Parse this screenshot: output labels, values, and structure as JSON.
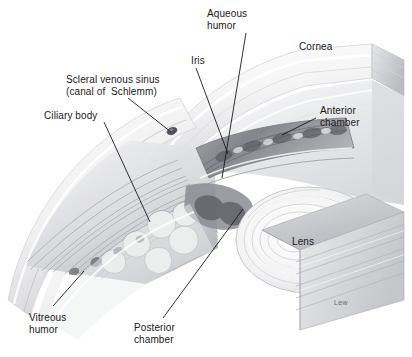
{
  "figure": {
    "background": "#ffffff",
    "ink": "#1a1a1a",
    "signature": "Lew"
  },
  "labels": [
    {
      "id": "aqueous-humor",
      "text": "Aqueous\nhumor",
      "x": 207,
      "y": 8,
      "align": "left"
    },
    {
      "id": "cornea",
      "text": "Cornea",
      "x": 299,
      "y": 41,
      "align": "left"
    },
    {
      "id": "iris",
      "text": "Iris",
      "x": 191,
      "y": 55,
      "align": "left"
    },
    {
      "id": "scleral-venous-sinus",
      "text": "Scleral venous sinus\n(canal of  Schlemm)",
      "x": 66,
      "y": 74,
      "align": "left"
    },
    {
      "id": "anterior-chamber",
      "text": "Anterior\nchamber",
      "x": 320,
      "y": 105,
      "align": "left"
    },
    {
      "id": "ciliary-body",
      "text": "Ciliary body",
      "x": 44,
      "y": 110,
      "align": "left"
    },
    {
      "id": "lens",
      "text": "Lens",
      "x": 292,
      "y": 236,
      "align": "left"
    },
    {
      "id": "vitreous-humor",
      "text": "Vitreous\nhumor",
      "x": 29,
      "y": 312,
      "align": "left"
    },
    {
      "id": "posterior-chamber",
      "text": "Posterior\nchamber",
      "x": 134,
      "y": 322,
      "align": "left"
    }
  ],
  "leaders": [
    {
      "id": "leader-aqueous-humor",
      "x1": 246,
      "y1": 33,
      "x2": 222,
      "y2": 178
    },
    {
      "id": "leader-iris",
      "x1": 196,
      "y1": 68,
      "x2": 228,
      "y2": 154
    },
    {
      "id": "leader-scleral-venous-sinus",
      "x1": 128,
      "y1": 98,
      "x2": 171,
      "y2": 132
    },
    {
      "id": "leader-ciliary-body",
      "x1": 104,
      "y1": 122,
      "x2": 150,
      "y2": 222
    },
    {
      "id": "leader-anterior-chamber",
      "x1": 316,
      "y1": 118,
      "x2": 282,
      "y2": 135
    },
    {
      "id": "leader-posterior-chamber",
      "x1": 163,
      "y1": 318,
      "x2": 243,
      "y2": 209
    },
    {
      "id": "leader-vitreous-humor",
      "x1": 53,
      "y1": 306,
      "x2": 84,
      "y2": 271
    }
  ],
  "structures": [
    {
      "id": "cornea",
      "name": "Cornea"
    },
    {
      "id": "sclera",
      "name": "Sclera"
    },
    {
      "id": "iris",
      "name": "Iris"
    },
    {
      "id": "lens",
      "name": "Lens"
    },
    {
      "id": "ciliary-body",
      "name": "Ciliary body"
    },
    {
      "id": "scleral-venous-sinus",
      "name": "Scleral venous sinus (canal of Schlemm)"
    },
    {
      "id": "anterior-chamber",
      "name": "Anterior chamber"
    },
    {
      "id": "posterior-chamber",
      "name": "Posterior chamber"
    },
    {
      "id": "vitreous-humor",
      "name": "Vitreous humor"
    },
    {
      "id": "aqueous-humor",
      "name": "Aqueous humor"
    }
  ]
}
